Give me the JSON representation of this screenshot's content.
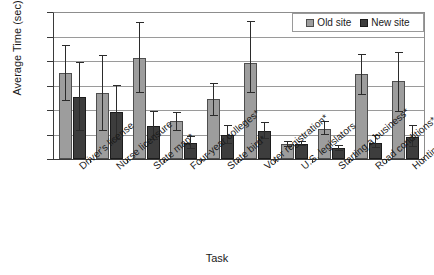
{
  "chart_data": {
    "type": "bar",
    "title": "",
    "xlabel": "Task",
    "ylabel": "Average Time (sec)",
    "ylim": [
      0,
      300
    ],
    "yticks": [
      0,
      50,
      100,
      150,
      200,
      250,
      300
    ],
    "grid": true,
    "legend_position": "top-right-inside",
    "categories": [
      "Driver's license",
      "Nurse licensure",
      "State map*",
      "Four-year colleges*",
      "State bird*",
      "Voter registration*",
      "U.S. legislators",
      "Starting a business*",
      "Road conditions*",
      "Hunting license*"
    ],
    "series": [
      {
        "name": "Old site",
        "color": "#9d9d9d",
        "values": [
          175,
          135,
          207,
          77,
          122,
          196,
          30,
          62,
          174,
          160
        ],
        "err_low": [
          118,
          57,
          134,
          57,
          88,
          135,
          25,
          50,
          130,
          95
        ],
        "err_high": [
          233,
          212,
          280,
          95,
          155,
          282,
          36,
          77,
          215,
          218
        ]
      },
      {
        "name": "New site",
        "color": "#3d3d3d",
        "values": [
          127,
          95,
          68,
          33,
          50,
          57,
          31,
          22,
          33,
          45
        ],
        "err_low": [
          57,
          38,
          38,
          20,
          30,
          40,
          26,
          17,
          22,
          25
        ],
        "err_high": [
          197,
          151,
          98,
          47,
          70,
          75,
          37,
          28,
          50,
          70
        ]
      }
    ]
  },
  "legend": {
    "old_label": "Old site",
    "new_label": "New site"
  }
}
